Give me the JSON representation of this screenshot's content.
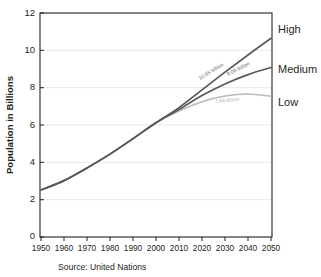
{
  "chart_data": {
    "type": "line",
    "title": "",
    "xlabel": "",
    "ylabel": "Population in Billions",
    "xlim": [
      1950,
      2050
    ],
    "ylim": [
      0,
      12
    ],
    "grid": true,
    "legend_position": "right-of-plot-inline",
    "x": [
      1950,
      1960,
      1970,
      1980,
      1990,
      2000,
      2010,
      2020,
      2030,
      2040,
      2050
    ],
    "xtick_labels": [
      "1950",
      "1960",
      "1970",
      "1980",
      "1990",
      "2000",
      "2010",
      "2020",
      "2030",
      "2040",
      "2050"
    ],
    "ytick_labels": [
      "0",
      "2",
      "4",
      "6",
      "8",
      "10",
      "12"
    ],
    "ytick_values": [
      0,
      2,
      4,
      6,
      8,
      10,
      12
    ],
    "series": [
      {
        "name": "High",
        "label": "High",
        "color": "#58595b",
        "end_value_label": "10.65 billion",
        "values": [
          2.52,
          3.02,
          3.7,
          4.44,
          5.27,
          6.12,
          6.93,
          7.88,
          8.83,
          9.75,
          10.65
        ]
      },
      {
        "name": "Medium",
        "label": "Medium",
        "color": "#58595b",
        "end_value_label": "9.08 billion",
        "values": [
          2.52,
          3.02,
          3.7,
          4.44,
          5.27,
          6.12,
          6.83,
          7.58,
          8.2,
          8.7,
          9.08
        ]
      },
      {
        "name": "Low",
        "label": "Low",
        "color": "#b9babc",
        "end_value_label": "7.68 billion",
        "values": [
          2.52,
          3.02,
          3.7,
          4.44,
          5.27,
          6.12,
          6.75,
          7.25,
          7.55,
          7.66,
          7.54
        ]
      }
    ],
    "annotations": [
      {
        "text": "10.65 billion",
        "series": "High"
      },
      {
        "text": "9.08 billion",
        "series": "Medium"
      },
      {
        "text": "7.68 billion",
        "series": "Low"
      }
    ],
    "source_note": "Source: United Nations"
  },
  "colors": {
    "ink": "#231f20",
    "dark_curve": "#58595b",
    "light_curve": "#b9babc",
    "gridline": "#e8e8e8",
    "background": "#ffffff"
  }
}
